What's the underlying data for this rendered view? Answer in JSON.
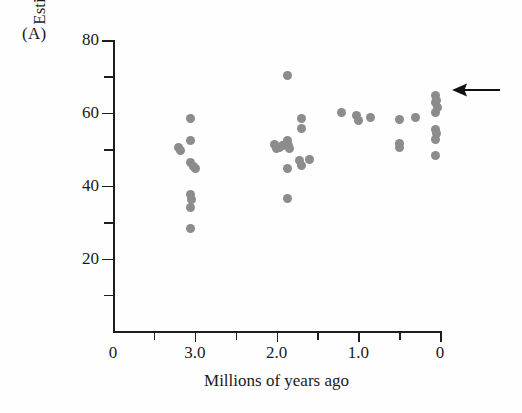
{
  "figure": {
    "panel_label": "(A)",
    "arrow_annotation_name": "left-pointing-arrow",
    "dot_color": "#8c8c8c",
    "axis_color": "#1d1d1d"
  },
  "chart_data": {
    "type": "scatter",
    "title": "",
    "panel": "(A)",
    "xlabel": "Millions of years ago",
    "ylabel": "Estimated body weight (kg)",
    "xlim": [
      4.0,
      0.0
    ],
    "ylim": [
      0,
      80
    ],
    "x_axis_reversed": true,
    "grid": false,
    "legend": null,
    "xticks_major": [
      3.0,
      2.0,
      1.0,
      0
    ],
    "xtick_labels": [
      "0",
      "3.0",
      "2.0",
      "1.0",
      "0"
    ],
    "xtick_label_values": [
      4.0,
      3.0,
      2.0,
      1.0,
      0
    ],
    "xticks_minor": [
      3.5,
      2.5,
      1.5,
      0.5
    ],
    "yticks_major": [
      20,
      40,
      60,
      80
    ],
    "ytick_labels": [
      "20",
      "40",
      "60",
      "80"
    ],
    "yticks_minor": [
      10,
      30,
      50,
      70
    ],
    "annotations": [
      {
        "type": "arrow",
        "direction": "left",
        "points_to_y": 64.5,
        "points_to_x": 0.0,
        "text": ""
      }
    ],
    "points": [
      {
        "x": 3.2,
        "y": 50.6
      },
      {
        "x": 3.18,
        "y": 49.8
      },
      {
        "x": 3.05,
        "y": 58.5
      },
      {
        "x": 3.05,
        "y": 52.5
      },
      {
        "x": 3.05,
        "y": 46.5
      },
      {
        "x": 3.02,
        "y": 45.2
      },
      {
        "x": 2.99,
        "y": 44.6
      },
      {
        "x": 3.05,
        "y": 37.5
      },
      {
        "x": 3.04,
        "y": 36.2
      },
      {
        "x": 3.05,
        "y": 34.0
      },
      {
        "x": 3.05,
        "y": 28.2
      },
      {
        "x": 1.86,
        "y": 70.2
      },
      {
        "x": 2.03,
        "y": 51.4
      },
      {
        "x": 2.0,
        "y": 50.3
      },
      {
        "x": 1.96,
        "y": 50.6
      },
      {
        "x": 1.93,
        "y": 51.0
      },
      {
        "x": 1.87,
        "y": 52.3
      },
      {
        "x": 1.85,
        "y": 51.1
      },
      {
        "x": 1.84,
        "y": 50.2
      },
      {
        "x": 1.86,
        "y": 44.8
      },
      {
        "x": 1.86,
        "y": 36.5
      },
      {
        "x": 1.7,
        "y": 58.5
      },
      {
        "x": 1.7,
        "y": 55.7
      },
      {
        "x": 1.72,
        "y": 46.8
      },
      {
        "x": 1.7,
        "y": 45.6
      },
      {
        "x": 1.6,
        "y": 47.3
      },
      {
        "x": 1.2,
        "y": 60.0
      },
      {
        "x": 1.02,
        "y": 59.3
      },
      {
        "x": 1.0,
        "y": 57.9
      },
      {
        "x": 0.85,
        "y": 58.7
      },
      {
        "x": 0.5,
        "y": 58.2
      },
      {
        "x": 0.5,
        "y": 51.6
      },
      {
        "x": 0.5,
        "y": 50.5
      },
      {
        "x": 0.3,
        "y": 58.7
      },
      {
        "x": 0.05,
        "y": 64.8
      },
      {
        "x": 0.06,
        "y": 62.8
      },
      {
        "x": 0.04,
        "y": 63.4
      },
      {
        "x": 0.03,
        "y": 61.4
      },
      {
        "x": 0.05,
        "y": 60.2
      },
      {
        "x": 0.06,
        "y": 55.4
      },
      {
        "x": 0.04,
        "y": 54.3
      },
      {
        "x": 0.06,
        "y": 52.6
      },
      {
        "x": 0.05,
        "y": 48.4
      }
    ]
  }
}
